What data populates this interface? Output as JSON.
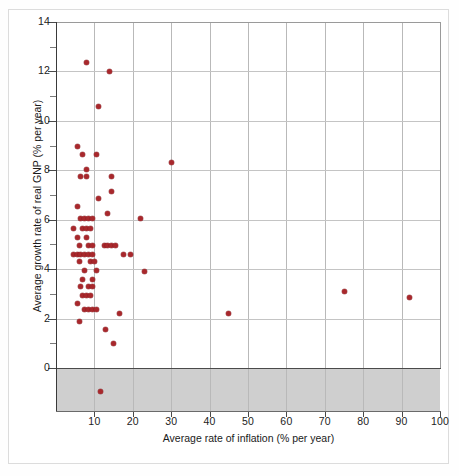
{
  "chart_data": {
    "type": "scatter",
    "title": "",
    "xlabel": "Average rate of inflation (% per year)",
    "ylabel": "Average growth rate of real GNP (% per year)",
    "xlim": [
      0,
      100
    ],
    "ylim": [
      -1.6,
      14
    ],
    "xticks": [
      10,
      20,
      30,
      40,
      50,
      60,
      70,
      80,
      90,
      100
    ],
    "yticks": [
      0,
      2,
      4,
      6,
      8,
      10,
      12,
      14
    ],
    "y_minor_ticks": [
      1,
      3,
      5,
      7,
      9,
      11,
      13
    ],
    "grid": true,
    "legend": "none",
    "point_color": "#a8282c",
    "negative_band_color": "#cfcfcf",
    "negative_band_range": [
      -1.6,
      0
    ],
    "points": [
      {
        "x": 8.0,
        "y": 12.35
      },
      {
        "x": 14.0,
        "y": 12.0
      },
      {
        "x": 11.0,
        "y": 10.6
      },
      {
        "x": 5.5,
        "y": 8.95
      },
      {
        "x": 7.0,
        "y": 8.65
      },
      {
        "x": 10.5,
        "y": 8.65
      },
      {
        "x": 30.0,
        "y": 8.3
      },
      {
        "x": 8.0,
        "y": 8.05
      },
      {
        "x": 6.5,
        "y": 7.75
      },
      {
        "x": 8.0,
        "y": 7.75
      },
      {
        "x": 14.5,
        "y": 7.75
      },
      {
        "x": 14.5,
        "y": 7.15
      },
      {
        "x": 11.0,
        "y": 6.85
      },
      {
        "x": 5.5,
        "y": 6.55
      },
      {
        "x": 13.5,
        "y": 6.25
      },
      {
        "x": 6.5,
        "y": 6.05
      },
      {
        "x": 7.5,
        "y": 6.05
      },
      {
        "x": 8.5,
        "y": 6.05
      },
      {
        "x": 9.5,
        "y": 6.05
      },
      {
        "x": 22.0,
        "y": 6.05
      },
      {
        "x": 4.5,
        "y": 5.65
      },
      {
        "x": 7.0,
        "y": 5.65
      },
      {
        "x": 8.0,
        "y": 5.65
      },
      {
        "x": 9.0,
        "y": 5.65
      },
      {
        "x": 5.5,
        "y": 5.3
      },
      {
        "x": 8.0,
        "y": 5.3
      },
      {
        "x": 6.0,
        "y": 4.95
      },
      {
        "x": 8.5,
        "y": 4.95
      },
      {
        "x": 9.5,
        "y": 4.95
      },
      {
        "x": 12.5,
        "y": 4.95
      },
      {
        "x": 13.5,
        "y": 4.95
      },
      {
        "x": 14.5,
        "y": 4.95
      },
      {
        "x": 15.5,
        "y": 4.95
      },
      {
        "x": 4.5,
        "y": 4.6
      },
      {
        "x": 5.5,
        "y": 4.6
      },
      {
        "x": 6.5,
        "y": 4.6
      },
      {
        "x": 7.5,
        "y": 4.6
      },
      {
        "x": 8.5,
        "y": 4.6
      },
      {
        "x": 9.5,
        "y": 4.6
      },
      {
        "x": 17.5,
        "y": 4.6
      },
      {
        "x": 19.5,
        "y": 4.6
      },
      {
        "x": 6.0,
        "y": 4.3
      },
      {
        "x": 9.0,
        "y": 4.3
      },
      {
        "x": 10.0,
        "y": 4.3
      },
      {
        "x": 7.5,
        "y": 3.95
      },
      {
        "x": 10.5,
        "y": 3.95
      },
      {
        "x": 23.0,
        "y": 3.9
      },
      {
        "x": 7.0,
        "y": 3.6
      },
      {
        "x": 9.5,
        "y": 3.6
      },
      {
        "x": 6.5,
        "y": 3.3
      },
      {
        "x": 8.5,
        "y": 3.3
      },
      {
        "x": 9.5,
        "y": 3.3
      },
      {
        "x": 7.0,
        "y": 2.95
      },
      {
        "x": 8.0,
        "y": 2.95
      },
      {
        "x": 9.0,
        "y": 2.95
      },
      {
        "x": 5.5,
        "y": 2.6
      },
      {
        "x": 7.5,
        "y": 2.35
      },
      {
        "x": 8.5,
        "y": 2.35
      },
      {
        "x": 9.5,
        "y": 2.35
      },
      {
        "x": 10.5,
        "y": 2.35
      },
      {
        "x": 16.5,
        "y": 2.2
      },
      {
        "x": 45.0,
        "y": 2.2
      },
      {
        "x": 75.0,
        "y": 3.1
      },
      {
        "x": 92.0,
        "y": 2.85
      },
      {
        "x": 6.0,
        "y": 1.9
      },
      {
        "x": 13.0,
        "y": 1.55
      },
      {
        "x": 15.0,
        "y": 1.0
      },
      {
        "x": 11.5,
        "y": -0.95
      }
    ]
  },
  "axes": {
    "x_tick_labels": [
      "10",
      "20",
      "30",
      "40",
      "50",
      "60",
      "70",
      "80",
      "90",
      "100"
    ],
    "y_tick_labels": [
      "0",
      "2",
      "4",
      "6",
      "8",
      "10",
      "12",
      "14"
    ],
    "x_title": "Average rate of inflation (% per year)",
    "y_title": "Average growth rate of real GNP (% per year)"
  }
}
